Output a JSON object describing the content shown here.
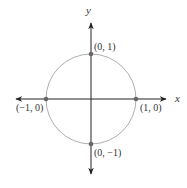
{
  "diagram": {
    "type": "unit-circle",
    "axes": {
      "x_label": "x",
      "y_label": "y"
    },
    "points": [
      {
        "label": "(0, 1)",
        "x": 0,
        "y": 1
      },
      {
        "label": "(−1, 0)",
        "x": -1,
        "y": 0
      },
      {
        "label": "(1, 0)",
        "x": 1,
        "y": 0
      },
      {
        "label": "(0, −1)",
        "x": 0,
        "y": -1
      }
    ],
    "colors": {
      "axis": "#222222",
      "circle": "#999999",
      "point": "#666666"
    }
  }
}
